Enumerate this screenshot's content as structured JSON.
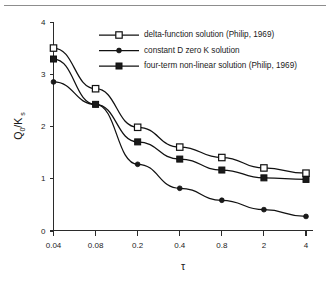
{
  "chart_data": {
    "type": "line",
    "title": "",
    "xlabel": "τ",
    "ylabel": "Q0/Ks",
    "ylabel_main": "Q",
    "ylabel_sub1": "0",
    "ylabel_mid": "/K",
    "ylabel_sub2": "s",
    "categories": [
      "0.04",
      "0.08",
      "0.2",
      "0.4",
      "0.8",
      "2",
      "4"
    ],
    "x_tick_labels": [
      "0.04",
      "0.08",
      "0.2",
      "0.4",
      "0.8",
      "2",
      "4"
    ],
    "y_tick_labels": [
      "0",
      "1",
      "2",
      "3",
      "4"
    ],
    "y_tick_values": [
      0,
      1,
      2,
      3,
      4
    ],
    "ylim": [
      0,
      4
    ],
    "grid": false,
    "legend_position": "top-right-inside",
    "series": [
      {
        "name": "delta-function solution (Philip, 1969)",
        "marker": "open-square",
        "values": [
          3.5,
          2.72,
          1.98,
          1.6,
          1.4,
          1.2,
          1.1
        ]
      },
      {
        "name": "constant D zero K solution",
        "marker": "filled-dot",
        "values": [
          2.85,
          2.42,
          1.27,
          0.81,
          0.58,
          0.4,
          0.27
        ]
      },
      {
        "name": "four-term non-linear solution (Philip, 1969)",
        "marker": "filled-square",
        "values": [
          3.29,
          2.42,
          1.7,
          1.37,
          1.16,
          1.01,
          0.98
        ]
      }
    ]
  },
  "legend": {
    "entries": [
      {
        "label": "delta-function solution (Philip, 1969)",
        "marker": "open-square"
      },
      {
        "label": "constant D zero K solution",
        "marker": "filled-dot"
      },
      {
        "label": "four-term non-linear solution (Philip, 1969)",
        "marker": "filled-square"
      }
    ]
  },
  "colors": {
    "axis": "#2b2b2b",
    "series": "#111111",
    "background": "#ffffff",
    "rule": "#8d8d8d"
  }
}
